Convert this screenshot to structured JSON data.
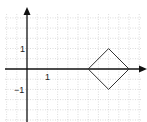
{
  "diagram": {
    "type": "coordinate-plane",
    "x_axis": {
      "tick_label": "1",
      "tick_value": 1
    },
    "y_axis": {
      "tick_label_pos": "1",
      "tick_label_neg": "−1"
    },
    "grid": {
      "minor_step": 0.5,
      "style": "dotted",
      "color": "#bbbbbb"
    },
    "shape": {
      "name": "diamond",
      "vertices": [
        [
          3,
          0
        ],
        [
          4,
          1
        ],
        [
          5,
          0
        ],
        [
          4,
          -1
        ]
      ],
      "stroke": "#333333"
    },
    "colors": {
      "axis": "#111111",
      "grid": "#bbbbbb",
      "shape": "#333333"
    }
  }
}
